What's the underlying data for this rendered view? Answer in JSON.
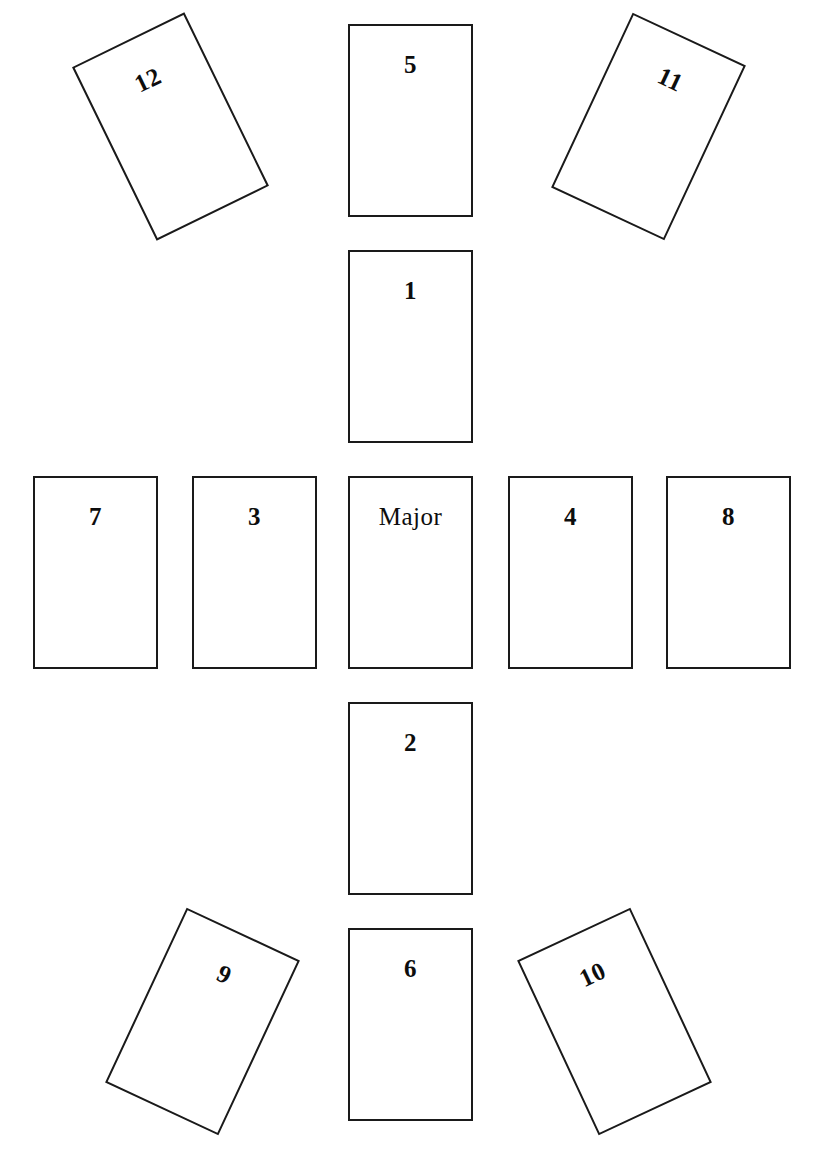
{
  "diagram": {
    "card_count": 13,
    "card_width": 125,
    "card_height": 193,
    "border_color": "#1a1a1a",
    "card_fill": "#ffffff",
    "background": "#ffffff",
    "label_color": "#0d0d0d"
  },
  "cards": [
    {
      "id": "card-12",
      "label": "12",
      "x": 108,
      "y": 30,
      "rotation": -26,
      "label_offset": 30
    },
    {
      "id": "card-5",
      "label": "5",
      "x": 348,
      "y": 24,
      "rotation": 0,
      "label_offset": 26
    },
    {
      "id": "card-11",
      "label": "11",
      "x": 586,
      "y": 30,
      "rotation": 25,
      "label_offset": 30
    },
    {
      "id": "card-1",
      "label": "1",
      "x": 348,
      "y": 250,
      "rotation": 0,
      "label_offset": 26
    },
    {
      "id": "card-7",
      "label": "7",
      "x": 33,
      "y": 476,
      "rotation": 0,
      "label_offset": 26
    },
    {
      "id": "card-3",
      "label": "3",
      "x": 192,
      "y": 476,
      "rotation": 0,
      "label_offset": 26
    },
    {
      "id": "card-major",
      "label": "Major",
      "x": 348,
      "y": 476,
      "rotation": 0,
      "label_offset": 26
    },
    {
      "id": "card-4",
      "label": "4",
      "x": 508,
      "y": 476,
      "rotation": 0,
      "label_offset": 26
    },
    {
      "id": "card-8",
      "label": "8",
      "x": 666,
      "y": 476,
      "rotation": 0,
      "label_offset": 26
    },
    {
      "id": "card-2",
      "label": "2",
      "x": 348,
      "y": 702,
      "rotation": 0,
      "label_offset": 26
    },
    {
      "id": "card-9",
      "label": "9",
      "x": 140,
      "y": 925,
      "rotation": 25,
      "label_offset": 30
    },
    {
      "id": "card-6",
      "label": "6",
      "x": 348,
      "y": 928,
      "rotation": 0,
      "label_offset": 26
    },
    {
      "id": "card-10",
      "label": "10",
      "x": 552,
      "y": 925,
      "rotation": -25,
      "label_offset": 30
    }
  ]
}
